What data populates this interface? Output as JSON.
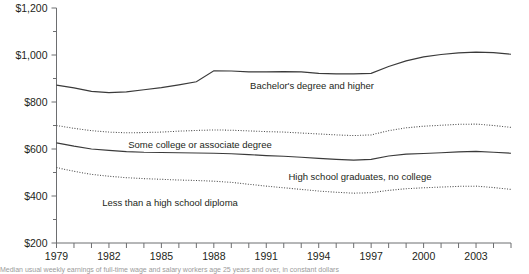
{
  "chart_data": {
    "type": "line",
    "title": "",
    "xlabel": "",
    "ylabel": "",
    "ylim": [
      200,
      1200
    ],
    "xlim": [
      1979,
      2005
    ],
    "grid": false,
    "legend_position": "inline-labels",
    "y_ticks": [
      "$200",
      "$400",
      "$600",
      "$800",
      "$1,000",
      "$1,200"
    ],
    "y_tick_values": [
      200,
      400,
      600,
      800,
      1000,
      1200
    ],
    "y_minor_tick_values": [
      300,
      500,
      700,
      900,
      1100
    ],
    "x_ticks": [
      "1979",
      "1982",
      "1985",
      "1988",
      "1991",
      "1994",
      "1997",
      "2000",
      "2003"
    ],
    "x_tick_values": [
      1979,
      1982,
      1985,
      1988,
      1991,
      1994,
      1997,
      2000,
      2003
    ],
    "x": [
      1979,
      1980,
      1981,
      1982,
      1983,
      1984,
      1985,
      1986,
      1987,
      1988,
      1989,
      1990,
      1991,
      1992,
      1993,
      1994,
      1995,
      1996,
      1997,
      1998,
      1999,
      2000,
      2001,
      2002,
      2003,
      2004,
      2005
    ],
    "series": [
      {
        "name": "Bachelor's degree and higher",
        "style": "solid",
        "label": "Bachelor's degree and higher",
        "values": [
          872,
          860,
          845,
          840,
          843,
          852,
          861,
          873,
          886,
          933,
          932,
          928,
          928,
          929,
          928,
          922,
          920,
          920,
          922,
          951,
          975,
          992,
          1002,
          1009,
          1012,
          1010,
          1003
        ]
      },
      {
        "name": "Some college or associate degree",
        "style": "dotted",
        "label": "Some college or associate degree",
        "values": [
          700,
          688,
          678,
          672,
          669,
          670,
          672,
          676,
          679,
          681,
          680,
          677,
          674,
          672,
          668,
          664,
          660,
          657,
          660,
          678,
          690,
          697,
          701,
          705,
          706,
          700,
          692
        ]
      },
      {
        "name": "High school graduates, no college",
        "style": "solid",
        "label": "High school graduates, no college",
        "values": [
          626,
          612,
          600,
          594,
          589,
          586,
          585,
          584,
          583,
          582,
          580,
          576,
          572,
          569,
          565,
          560,
          556,
          553,
          556,
          570,
          578,
          581,
          584,
          588,
          590,
          586,
          582
        ]
      },
      {
        "name": "Less than a high school diploma",
        "style": "dotted",
        "label": "Less than a high school diploma",
        "values": [
          521,
          505,
          492,
          484,
          478,
          474,
          471,
          468,
          466,
          463,
          458,
          450,
          442,
          435,
          428,
          421,
          416,
          412,
          414,
          424,
          431,
          435,
          438,
          441,
          442,
          436,
          428
        ]
      }
    ]
  },
  "footnote": {
    "text": "Median usual weekly earnings of full-time wage and salary workers age 25 years and over, in constant dollars"
  }
}
